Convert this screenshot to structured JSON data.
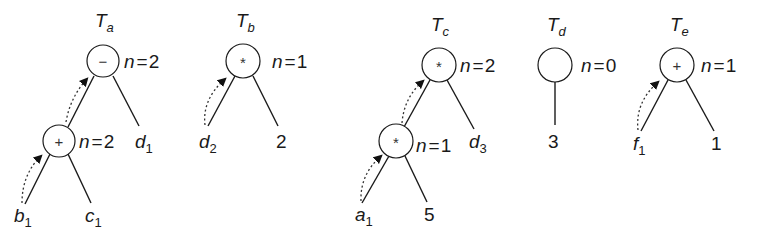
{
  "diagram": {
    "type": "expression-trees",
    "trees": [
      {
        "id": "Ta",
        "title": {
          "base": "T",
          "sub": "a"
        },
        "root": {
          "op": "−",
          "n_label": "n = 2",
          "n_val": "2"
        },
        "inner": {
          "op": "+",
          "n_label": "n = 2",
          "n_val": "2"
        },
        "leaves": [
          {
            "base": "b",
            "sub": "1"
          },
          {
            "base": "c",
            "sub": "1"
          },
          {
            "base": "d",
            "sub": "1"
          }
        ]
      },
      {
        "id": "Tb",
        "title": {
          "base": "T",
          "sub": "b"
        },
        "root": {
          "op": "*",
          "n_label": "n = 1",
          "n_val": "1"
        },
        "leaves": [
          {
            "base": "d",
            "sub": "2"
          },
          {
            "base": "2",
            "sub": ""
          }
        ]
      },
      {
        "id": "Tc",
        "title": {
          "base": "T",
          "sub": "c"
        },
        "root": {
          "op": "*",
          "n_label": "n = 2",
          "n_val": "2"
        },
        "inner": {
          "op": "*",
          "n_label": "n = 1",
          "n_val": "1"
        },
        "leaves": [
          {
            "base": "a",
            "sub": "1"
          },
          {
            "base": "5",
            "sub": ""
          },
          {
            "base": "d",
            "sub": "3"
          }
        ]
      },
      {
        "id": "Td",
        "title": {
          "base": "T",
          "sub": "d"
        },
        "root": {
          "op": "",
          "n_label": "n = 0",
          "n_val": "0"
        },
        "leaves": [
          {
            "base": "3",
            "sub": ""
          }
        ]
      },
      {
        "id": "Te",
        "title": {
          "base": "T",
          "sub": "e"
        },
        "root": {
          "op": "+",
          "n_label": "n = 1",
          "n_val": "1"
        },
        "leaves": [
          {
            "base": "f",
            "sub": "1"
          },
          {
            "base": "1",
            "sub": ""
          }
        ]
      }
    ],
    "n_prefix": "n",
    "eq": "="
  }
}
